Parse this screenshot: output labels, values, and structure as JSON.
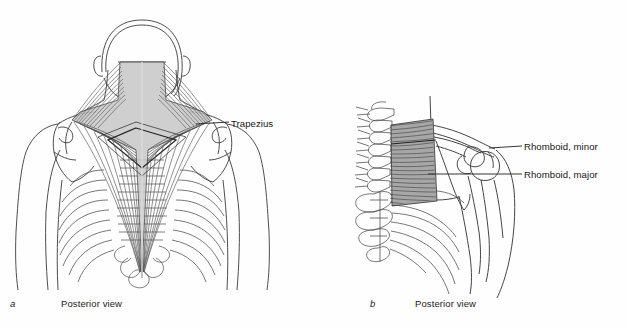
{
  "figure": {
    "type": "anatomical-illustration",
    "style": "line-drawing",
    "background_color": "#ffffff",
    "ink_color": "#2b2b2b",
    "muscle_shade_color": "#8c8c8c"
  },
  "panels": [
    {
      "letter": "a",
      "caption": "Posterior view",
      "subject": "upper back with trapezius muscle",
      "labels": [
        {
          "text": "Trapezius",
          "leader": "from right shoulder region to label"
        }
      ]
    },
    {
      "letter": "b",
      "caption": "Posterior view",
      "subject": "vertebral column, scapula and rhomboid muscles",
      "labels": [
        {
          "text": "Rhomboid, minor",
          "leader": "from upper rhomboid region to label"
        },
        {
          "text": "Rhomboid, major",
          "leader": "from lower rhomboid region to label"
        }
      ]
    }
  ],
  "labels": {
    "trapezius": "Trapezius",
    "rhomboid_minor": "Rhomboid, minor",
    "rhomboid_major": "Rhomboid, major"
  },
  "captions": {
    "a_letter": "a",
    "a_text": "Posterior view",
    "b_letter": "b",
    "b_text": "Posterior view"
  }
}
